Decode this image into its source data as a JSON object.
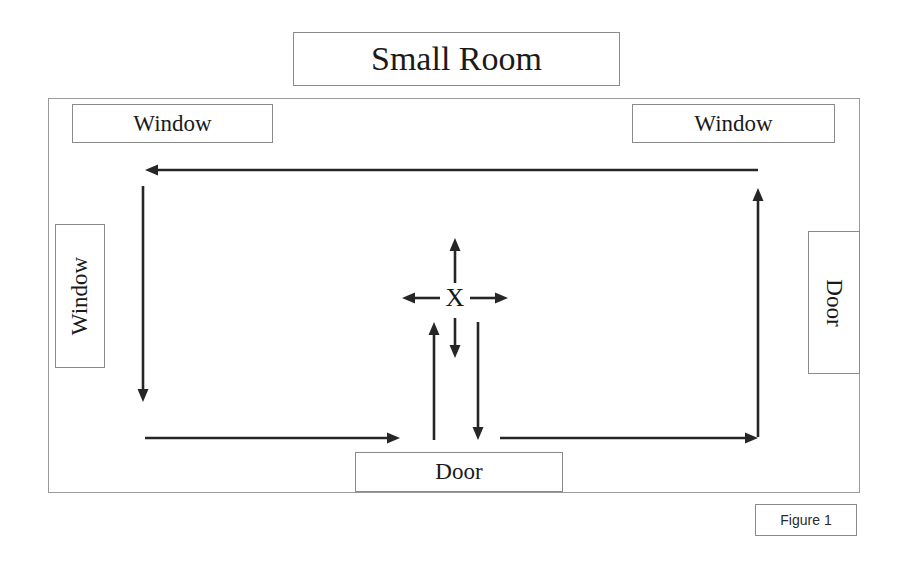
{
  "figure": {
    "title": "Small Room",
    "caption": "Figure 1",
    "center_marker": "X"
  },
  "room": {
    "labels": {
      "window_top_left": "Window",
      "window_top_right": "Window",
      "window_left": "Window",
      "door_right": "Door",
      "door_bottom": "Door"
    }
  },
  "colors": {
    "background": "#ffffff",
    "stroke": "#8a8a8a",
    "room_border": "#9a9a9a",
    "arrow": "#262626",
    "text": "#1a1a1a"
  },
  "chart_data": {
    "type": "diagram",
    "title": "Small Room",
    "caption": "Figure 1",
    "room_bounds": {
      "x": 48,
      "y": 98,
      "width": 812,
      "height": 395
    },
    "openings": [
      {
        "label": "Window",
        "wall": "top-left",
        "x": 72,
        "y": 104,
        "width": 201,
        "height": 39,
        "orientation": "horizontal"
      },
      {
        "label": "Window",
        "wall": "top-right",
        "x": 632,
        "y": 104,
        "width": 203,
        "height": 39,
        "orientation": "horizontal"
      },
      {
        "label": "Window",
        "wall": "left",
        "x": 55,
        "y": 224,
        "width": 50,
        "height": 144,
        "orientation": "vertical-ccw"
      },
      {
        "label": "Door",
        "wall": "right",
        "x": 808,
        "y": 231,
        "width": 52,
        "height": 143,
        "orientation": "vertical-cw"
      },
      {
        "label": "Door",
        "wall": "bottom",
        "x": 355,
        "y": 452,
        "width": 208,
        "height": 40,
        "orientation": "horizontal"
      }
    ],
    "center_marker": {
      "label": "X",
      "x": 455,
      "y": 298
    },
    "arrows": [
      {
        "name": "center-up",
        "x1": 455,
        "y1": 283,
        "x2": 455,
        "y2": 238,
        "direction": "up"
      },
      {
        "name": "center-left",
        "x1": 440,
        "y1": 298,
        "x2": 402,
        "y2": 298,
        "direction": "left"
      },
      {
        "name": "center-right",
        "x1": 470,
        "y1": 298,
        "x2": 508,
        "y2": 298,
        "direction": "right"
      },
      {
        "name": "center-down",
        "x1": 455,
        "y1": 318,
        "x2": 455,
        "y2": 358,
        "direction": "down"
      },
      {
        "name": "perimeter-top",
        "x1": 758,
        "y1": 170,
        "x2": 145,
        "y2": 170,
        "direction": "left"
      },
      {
        "name": "perimeter-left",
        "x1": 143,
        "y1": 186,
        "x2": 143,
        "y2": 402,
        "direction": "down"
      },
      {
        "name": "perimeter-right",
        "x1": 758,
        "y1": 437,
        "x2": 758,
        "y2": 188,
        "direction": "up"
      },
      {
        "name": "bottom-left",
        "x1": 145,
        "y1": 438,
        "x2": 400,
        "y2": 438,
        "direction": "right"
      },
      {
        "name": "bottom-right",
        "x1": 500,
        "y1": 438,
        "x2": 758,
        "y2": 438,
        "direction": "right"
      },
      {
        "name": "lower-center-up",
        "x1": 434,
        "y1": 440,
        "x2": 434,
        "y2": 322,
        "direction": "up"
      },
      {
        "name": "lower-center-down",
        "x1": 478,
        "y1": 322,
        "x2": 478,
        "y2": 440,
        "direction": "down"
      }
    ]
  }
}
